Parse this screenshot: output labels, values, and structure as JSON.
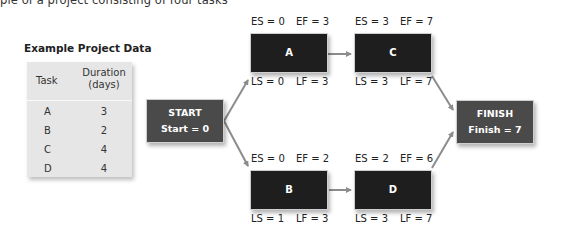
{
  "caption": "ple of a project consisting of four tasks",
  "table": {
    "title": "Example Project Data",
    "headers": {
      "task": "Task",
      "duration_line1": "Duration",
      "duration_line2": "(days)"
    },
    "rows": [
      {
        "task": "A",
        "duration": "3"
      },
      {
        "task": "B",
        "duration": "2"
      },
      {
        "task": "C",
        "duration": "4"
      },
      {
        "task": "D",
        "duration": "4"
      }
    ]
  },
  "network": {
    "start": {
      "title": "START",
      "value": "Start = 0"
    },
    "finish": {
      "title": "FINISH",
      "value": "Finish = 7"
    },
    "tasks": {
      "A": {
        "label": "A",
        "es": "ES = 0",
        "ef": "EF = 3",
        "ls": "LS = 0",
        "lf": "LF = 3"
      },
      "B": {
        "label": "B",
        "es": "ES = 0",
        "ef": "EF = 2",
        "ls": "LS = 1",
        "lf": "LF = 3"
      },
      "C": {
        "label": "C",
        "es": "ES = 3",
        "ef": "EF = 7",
        "ls": "LS = 3",
        "lf": "LF = 7"
      },
      "D": {
        "label": "D",
        "es": "ES = 2",
        "ef": "EF = 6",
        "ls": "LS = 3",
        "lf": "LF = 7"
      }
    },
    "edges": [
      [
        "START",
        "A"
      ],
      [
        "START",
        "B"
      ],
      [
        "A",
        "C"
      ],
      [
        "B",
        "D"
      ],
      [
        "C",
        "FINISH"
      ],
      [
        "D",
        "FINISH"
      ]
    ],
    "colors": {
      "task_box": "#1e1e1e",
      "terminal_box": "#4a4a4a",
      "arrow": "#8c8c8c",
      "table_bg": "#e6e6e6"
    }
  }
}
